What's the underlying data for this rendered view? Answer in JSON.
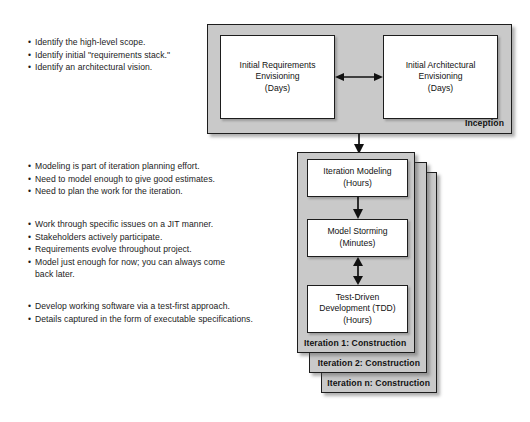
{
  "diagram": {
    "colors": {
      "phase_fill": "#c9c9c9",
      "activity_fill": "#ffffff",
      "outline": "#1d1d1d",
      "text": "#121212",
      "page_background": "#ffffff"
    },
    "bullet_groups": [
      {
        "id": "inception-notes",
        "lines": [
          {
            "text": "Identify the high-level scope.",
            "continuation": false
          },
          {
            "text": "Identify initial \"requirements stack.\"",
            "continuation": false
          },
          {
            "text": "Identify an architectural vision.",
            "continuation": false
          }
        ]
      },
      {
        "id": "iteration-modeling-notes",
        "lines": [
          {
            "text": "Modeling is part of iteration planning effort.",
            "continuation": false
          },
          {
            "text": "Need to model enough to give good estimates.",
            "continuation": false
          },
          {
            "text": "Need to plan the work for the iteration.",
            "continuation": false
          }
        ]
      },
      {
        "id": "model-storming-notes",
        "lines": [
          {
            "text": "Work through specific issues on a JIT manner.",
            "continuation": false
          },
          {
            "text": "Stakeholders actively participate.",
            "continuation": false
          },
          {
            "text": "Requirements evolve throughout project.",
            "continuation": false
          },
          {
            "text": "Model just enough for now; you can always come",
            "continuation": false
          },
          {
            "text": "back later.",
            "continuation": true
          }
        ]
      },
      {
        "id": "tdd-notes",
        "lines": [
          {
            "text": "Develop working software via a test-first approach.",
            "continuation": false
          },
          {
            "text": "Details captured in the form of executable specifications.",
            "continuation": false
          }
        ]
      }
    ],
    "phases": [
      {
        "id": "inception",
        "label": "Inception",
        "activities": [
          {
            "id": "initial-requirements-envisioning",
            "lines": [
              "Initial Requirements",
              "Envisioning",
              "(Days)"
            ]
          },
          {
            "id": "initial-architectural-envisioning",
            "lines": [
              "Initial Architectural",
              "Envisioning",
              "(Days)"
            ]
          }
        ]
      },
      {
        "id": "construction",
        "label": "Iteration 1: Construction",
        "stack_labels": [
          "Iteration 1: Construction",
          "Iteration 2: Construction",
          "Iteration n: Construction"
        ],
        "activities": [
          {
            "id": "iteration-modeling",
            "lines": [
              "Iteration Modeling",
              "(Hours)"
            ]
          },
          {
            "id": "model-storming",
            "lines": [
              "Model Storming",
              "(Minutes)"
            ]
          },
          {
            "id": "test-driven-development",
            "lines": [
              "Test-Driven",
              "Development (TDD)",
              "(Hours)"
            ]
          }
        ]
      }
    ],
    "connectors": [
      {
        "id": "envisioning-bidirectional",
        "type": "double",
        "orientation": "horizontal"
      },
      {
        "id": "inception-to-construction",
        "type": "single",
        "orientation": "vertical-down"
      },
      {
        "id": "iteration-modeling-to-model-storming",
        "type": "single",
        "orientation": "vertical-down"
      },
      {
        "id": "model-storming-to-tdd",
        "type": "double",
        "orientation": "vertical"
      }
    ]
  }
}
